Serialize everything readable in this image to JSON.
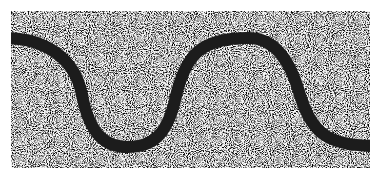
{
  "figure": {
    "background_color": "#ffffff",
    "noise_rect": {
      "x": 11,
      "y": 11,
      "width": 359,
      "height": 157
    },
    "noise_colors": {
      "light": "#f2f2f2",
      "dark": "#3a3a3a"
    },
    "curve": {
      "color": "#1c1c1c",
      "stroke_width": 12,
      "points": {
        "start": [
          11,
          38
        ],
        "trough": [
          128,
          147
        ],
        "peak": [
          248,
          38
        ],
        "end": [
          370,
          146
        ]
      }
    }
  }
}
